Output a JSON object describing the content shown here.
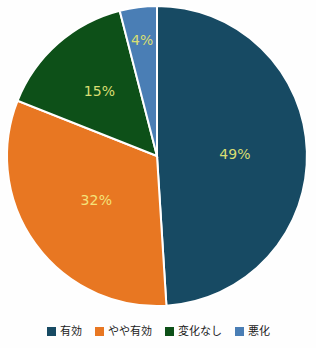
{
  "chart_data": {
    "type": "pie",
    "title": "",
    "xlabel": "",
    "ylabel": "",
    "categories": [
      "有効",
      "やや有効",
      "変化なし",
      "悪化"
    ],
    "values": [
      49,
      32,
      15,
      4
    ],
    "value_labels": [
      "49%",
      "32%",
      "15%",
      "4%"
    ],
    "colors": [
      "#174A63",
      "#E87722",
      "#0D5018",
      "#4A7EB5"
    ],
    "units": "%",
    "start_angle_deg": 0,
    "direction": "clockwise",
    "legend_position": "bottom",
    "grid": false,
    "slices": [
      {
        "label": "有効",
        "value": 49,
        "display": "49%",
        "color": "#174A63",
        "label_color": "#D9DE72"
      },
      {
        "label": "やや有効",
        "value": 32,
        "display": "32%",
        "color": "#E87722",
        "label_color": "#F5E27A"
      },
      {
        "label": "変化なし",
        "value": 15,
        "display": "15%",
        "color": "#0D5018",
        "label_color": "#D9DE72"
      },
      {
        "label": "悪化",
        "value": 4,
        "display": "4%",
        "color": "#4A7EB5",
        "label_color": "#D9DE72"
      }
    ]
  },
  "legend": {
    "items": [
      {
        "label": "有効",
        "color": "#174A63"
      },
      {
        "label": "やや有効",
        "color": "#E87722"
      },
      {
        "label": "変化なし",
        "color": "#0D5018"
      },
      {
        "label": "悪化",
        "color": "#4A7EB5"
      }
    ]
  },
  "style": {
    "background": "#fefefe",
    "separator_color": "#ffffff",
    "center_x": 157,
    "center_y": 156,
    "radius": 150
  }
}
